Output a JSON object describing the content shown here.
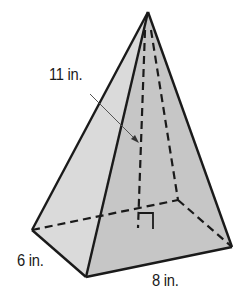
{
  "figure": {
    "type": "rectangular pyramid",
    "labels": {
      "height": "11 in.",
      "width": "6 in.",
      "length": "8 in."
    },
    "dimensions": {
      "height_in": 11,
      "base_width_in": 6,
      "base_length_in": 8
    },
    "colors": {
      "stroke": "#1a1a1a",
      "left_face": "#d8d8d8",
      "front_face": "#c4c4c4",
      "arrow": "#555555",
      "background": "#ffffff"
    }
  }
}
